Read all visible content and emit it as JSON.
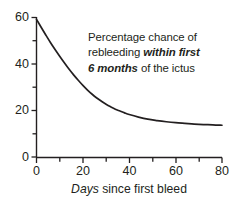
{
  "chart_data": {
    "type": "line",
    "title": "",
    "subtitle": "",
    "annotation_lines": [
      {
        "plain_before": "Percentage chance of",
        "emphasis": "",
        "plain_after": ""
      },
      {
        "plain_before": "rebleeding ",
        "emphasis": "within first",
        "plain_after": ""
      },
      {
        "plain_before": "",
        "emphasis": "6 months",
        "plain_after": " of the ictus"
      }
    ],
    "annotation_text": "Percentage chance of rebleeding within first 6 months of the ictus",
    "xlabel_italic": "Days",
    "xlabel_rest": " since first bleed",
    "xlabel": "Days since first bleed",
    "ylabel": "",
    "xlim": [
      0,
      80
    ],
    "ylim": [
      0,
      60
    ],
    "x_ticks_major": [
      0,
      20,
      40,
      60,
      80
    ],
    "x_ticks_minor": [
      10,
      30,
      50,
      70
    ],
    "y_ticks_major": [
      0,
      20,
      40,
      60
    ],
    "y_ticks_minor": [
      10,
      30,
      50
    ],
    "grid": false,
    "legend": "none",
    "line_color": "#231f20",
    "axis_color": "#231f20",
    "series": [
      {
        "name": "Percentage chance of rebleeding",
        "x": [
          0,
          2,
          4,
          6,
          8,
          10,
          12,
          14,
          16,
          18,
          20,
          22,
          24,
          26,
          28,
          30,
          32,
          34,
          36,
          38,
          40,
          44,
          48,
          52,
          56,
          60,
          64,
          68,
          72,
          76,
          80
        ],
        "values": [
          59.0,
          55.6,
          52.3,
          49.1,
          46.1,
          43.2,
          40.4,
          37.7,
          35.2,
          32.9,
          30.7,
          28.7,
          26.9,
          25.3,
          23.9,
          22.6,
          21.5,
          20.5,
          19.7,
          18.9,
          18.2,
          17.1,
          16.2,
          15.6,
          15.1,
          14.7,
          14.4,
          14.1,
          13.9,
          13.8,
          13.6
        ]
      }
    ]
  },
  "axes": {
    "y_tick_labels": [
      "60",
      "40",
      "20",
      "0"
    ],
    "x_tick_labels": [
      "0",
      "20",
      "40",
      "60",
      "80"
    ]
  }
}
